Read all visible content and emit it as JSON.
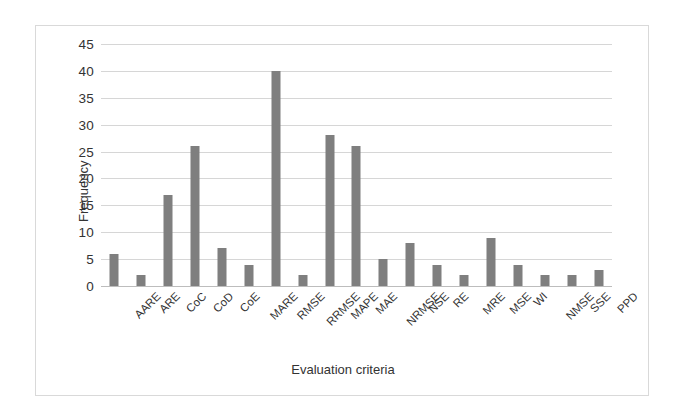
{
  "chart_data": {
    "type": "bar",
    "title": "",
    "xlabel": "Evaluation criteria",
    "ylabel": "Frequency",
    "categories": [
      "AARE",
      "ARE",
      "CoC",
      "CoD",
      "CoE",
      "MARE",
      "RMSE",
      "RRMSE",
      "MAPE",
      "MAE",
      "NRMSE",
      "NSE",
      "RE",
      "MRE",
      "MSE",
      "WI",
      "NMSE",
      "SSE",
      "PPD"
    ],
    "values": [
      6,
      2,
      17,
      26,
      7,
      4,
      40,
      2,
      28,
      26,
      5,
      8,
      4,
      2,
      9,
      4,
      2,
      2,
      3
    ],
    "ylim": [
      0,
      45
    ],
    "ytick_step": 5,
    "yticks": [
      "45",
      "40",
      "35",
      "30",
      "25",
      "20",
      "15",
      "10",
      "5",
      "0"
    ],
    "grid": true,
    "legend": "none",
    "bar_color": "#7f7f7f",
    "gridline_color": "#d6d6d6",
    "axis_text_color": "#333333",
    "frame_color": "#d9d9d9"
  }
}
